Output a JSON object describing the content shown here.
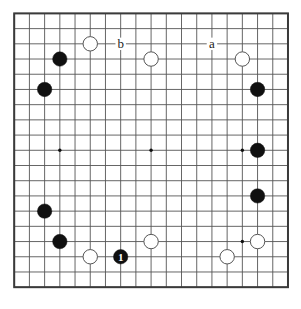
{
  "board": {
    "type": "go-board",
    "size": 19,
    "origin_x": 14.2,
    "origin_y": 13.4,
    "spacing": 15.21,
    "stone_radius": 7.2,
    "line_color": "#555555",
    "border_color": "#3a3a3a",
    "background_color": "#ffffff",
    "black_color": "#101010",
    "white_color": "#ffffff",
    "white_edge_color": "#555555",
    "star_points": [
      {
        "col": 3,
        "row": 3
      },
      {
        "col": 9,
        "row": 3
      },
      {
        "col": 15,
        "row": 3
      },
      {
        "col": 3,
        "row": 9
      },
      {
        "col": 9,
        "row": 9
      },
      {
        "col": 15,
        "row": 9
      },
      {
        "col": 3,
        "row": 15
      },
      {
        "col": 9,
        "row": 15
      },
      {
        "col": 15,
        "row": 15
      }
    ],
    "stones": [
      {
        "col": 5,
        "row": 2,
        "color": "white"
      },
      {
        "col": 9,
        "row": 3,
        "color": "white"
      },
      {
        "col": 15,
        "row": 3,
        "color": "white"
      },
      {
        "col": 3,
        "row": 3,
        "color": "black"
      },
      {
        "col": 2,
        "row": 5,
        "color": "black"
      },
      {
        "col": 16,
        "row": 5,
        "color": "black"
      },
      {
        "col": 16,
        "row": 9,
        "color": "black"
      },
      {
        "col": 16,
        "row": 12,
        "color": "black"
      },
      {
        "col": 2,
        "row": 13,
        "color": "black"
      },
      {
        "col": 3,
        "row": 15,
        "color": "black"
      },
      {
        "col": 5,
        "row": 16,
        "color": "white"
      },
      {
        "col": 7,
        "row": 16,
        "color": "black",
        "number": "1"
      },
      {
        "col": 9,
        "row": 15,
        "color": "white"
      },
      {
        "col": 14,
        "row": 16,
        "color": "white"
      },
      {
        "col": 16,
        "row": 15,
        "color": "white"
      }
    ],
    "annotations": [
      {
        "label": "b",
        "col": 7,
        "row": 2
      },
      {
        "label": "a",
        "col": 13,
        "row": 2
      }
    ]
  }
}
